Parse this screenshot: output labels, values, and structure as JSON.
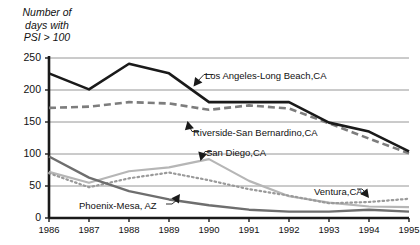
{
  "axis_title": "Number of\ndays with\nPSI > 100",
  "yticks": [
    "0",
    "50",
    "100",
    "150",
    "200",
    "250"
  ],
  "xticks": [
    "1986",
    "1987",
    "1988",
    "1989",
    "1990",
    "1991",
    "1992",
    "1993",
    "1994",
    "1995"
  ],
  "labels": {
    "los_angeles": "Los Angeles-Long Beach,CA",
    "riverside": "Riverside-San Bernardino,CA",
    "san_diego": "San Diego,CA",
    "ventura": "Ventura,CA",
    "phoenix": "Phoenix-Mesa, AZ"
  },
  "colors": {
    "los_angeles": "#1a1a1a",
    "riverside": "#7d7d7d",
    "san_diego": "#b6b6b6",
    "ventura": "#9a9a9a",
    "phoenix": "#6e6e6e",
    "axis": "#1a1a1a",
    "grid": "#8a8a8a"
  },
  "chart_data": {
    "type": "line",
    "title": "",
    "xlabel": "",
    "ylabel": "Number of days with PSI > 100",
    "x": [
      1986,
      1987,
      1988,
      1989,
      1990,
      1991,
      1992,
      1993,
      1994,
      1995
    ],
    "ylim": [
      0,
      250
    ],
    "xlim": [
      1986,
      1995
    ],
    "grid": true,
    "legend": "inline-annotations",
    "series": [
      {
        "name": "Los Angeles-Long Beach,CA",
        "style": "solid-thick-black",
        "values": [
          226,
          201,
          241,
          226,
          181,
          181,
          181,
          149,
          135,
          104
        ]
      },
      {
        "name": "Riverside-San Bernardino,CA",
        "style": "dashed-gray",
        "values": [
          172,
          174,
          181,
          179,
          169,
          176,
          171,
          148,
          124,
          101
        ]
      },
      {
        "name": "San Diego,CA",
        "style": "solid-light-gray",
        "values": [
          72,
          55,
          73,
          79,
          92,
          58,
          34,
          24,
          18,
          17
        ]
      },
      {
        "name": "Ventura,CA",
        "style": "dotted-gray",
        "values": [
          70,
          48,
          62,
          71,
          59,
          45,
          35,
          23,
          25,
          30
        ]
      },
      {
        "name": "Phoenix-Mesa, AZ",
        "style": "solid-medium-gray",
        "values": [
          96,
          63,
          42,
          29,
          20,
          13,
          10,
          10,
          13,
          10
        ]
      }
    ]
  }
}
